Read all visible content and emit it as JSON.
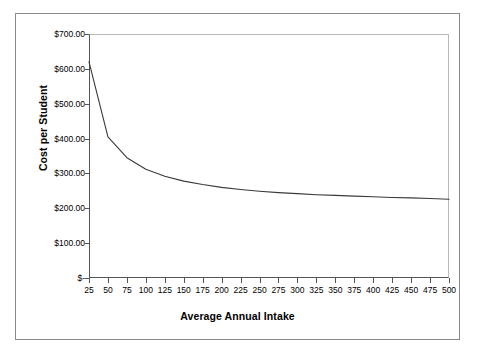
{
  "chart_data": {
    "type": "line",
    "title": "",
    "xlabel": "Average Annual Intake",
    "ylabel": "Cost per Student",
    "xlim": [
      25,
      500
    ],
    "ylim": [
      0,
      700
    ],
    "grid": false,
    "legend": "none",
    "line_color": "#3a3a3a",
    "x": [
      25,
      50,
      75,
      100,
      125,
      150,
      175,
      200,
      225,
      250,
      275,
      300,
      325,
      350,
      375,
      400,
      425,
      450,
      475,
      500
    ],
    "y_tick_labels": [
      "$-",
      "$100.00",
      "$200.00",
      "$300.00",
      "$400.00",
      "$500.00",
      "$600.00",
      "$700.00"
    ],
    "y_tick_values": [
      0,
      100,
      200,
      300,
      400,
      500,
      600,
      700
    ],
    "x_tick_labels": [
      "25",
      "50",
      "75",
      "100",
      "125",
      "150",
      "175",
      "200",
      "225",
      "250",
      "275",
      "300",
      "325",
      "350",
      "375",
      "400",
      "425",
      "450",
      "475",
      "500"
    ],
    "series": [
      {
        "name": "Cost per Student",
        "values": [
          620,
          405,
          345,
          312,
          292,
          278,
          268,
          260,
          254,
          249,
          245,
          242,
          239,
          237,
          235,
          233,
          231,
          230,
          228,
          226
        ]
      }
    ]
  }
}
